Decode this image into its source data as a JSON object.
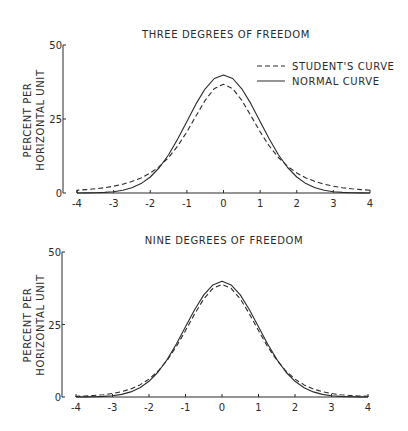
{
  "chart_data": [
    {
      "type": "line",
      "title": "THREE DEGREES OF FREEDOM",
      "xlabel": "",
      "ylabel": [
        "PERCENT PER",
        "HORIZONTAL UNIT"
      ],
      "xlim": [
        -4,
        4
      ],
      "ylim": [
        0,
        50
      ],
      "x_ticks": [
        "-4",
        "-3",
        "-2",
        "-1",
        "0",
        "1",
        "2",
        "3",
        "4"
      ],
      "y_ticks": [
        "0",
        "25",
        "50"
      ],
      "grid": false,
      "legend_position": "upper right",
      "x": [
        -4,
        -3.75,
        -3.5,
        -3.25,
        -3,
        -2.75,
        -2.5,
        -2.25,
        -2,
        -1.75,
        -1.5,
        -1.25,
        -1,
        -0.75,
        -0.5,
        -0.25,
        0,
        0.25,
        0.5,
        0.75,
        1,
        1.25,
        1.5,
        1.75,
        2,
        2.25,
        2.5,
        2.75,
        3,
        3.25,
        3.5,
        3.75,
        4
      ],
      "series": [
        {
          "name": "STUDENT'S CURVE",
          "style": "dashed",
          "values": [
            0.92,
            1.14,
            1.42,
            1.8,
            2.3,
            2.97,
            3.87,
            5.09,
            6.75,
            9.0,
            12.0,
            15.89,
            20.67,
            26.06,
            31.32,
            35.27,
            36.76,
            35.27,
            31.32,
            26.06,
            20.67,
            15.89,
            12.0,
            9.0,
            6.75,
            5.09,
            3.87,
            2.97,
            2.3,
            1.8,
            1.42,
            1.14,
            0.92
          ]
        },
        {
          "name": "NORMAL CURVE",
          "style": "solid",
          "values": [
            0.01,
            0.04,
            0.09,
            0.2,
            0.44,
            0.91,
            1.75,
            3.17,
            5.4,
            8.63,
            12.95,
            18.26,
            24.2,
            30.11,
            35.21,
            38.67,
            39.89,
            38.67,
            35.21,
            30.11,
            24.2,
            18.26,
            12.95,
            8.63,
            5.4,
            3.17,
            1.75,
            0.91,
            0.44,
            0.2,
            0.09,
            0.04,
            0.01
          ]
        }
      ]
    },
    {
      "type": "line",
      "title": "NINE DEGREES OF FREEDOM",
      "xlabel": "",
      "ylabel": [
        "PERCENT PER",
        "HORIZONTAL UNIT"
      ],
      "xlim": [
        -4,
        4
      ],
      "ylim": [
        0,
        50
      ],
      "x_ticks": [
        "-4",
        "-3",
        "-2",
        "-1",
        "0",
        "1",
        "2",
        "3",
        "4"
      ],
      "y_ticks": [
        "0",
        "25",
        "50"
      ],
      "grid": false,
      "legend_position": "none",
      "x": [
        -4,
        -3.75,
        -3.5,
        -3.25,
        -3,
        -2.75,
        -2.5,
        -2.25,
        -2,
        -1.75,
        -1.5,
        -1.25,
        -1,
        -0.75,
        -0.5,
        -0.25,
        0,
        0.25,
        0.5,
        0.75,
        1,
        1.25,
        1.5,
        1.75,
        2,
        2.25,
        2.5,
        2.75,
        3,
        3.25,
        3.5,
        3.75,
        4
      ],
      "series": [
        {
          "name": "STUDENT'S CURVE",
          "style": "dashed",
          "values": [
            0.24,
            0.35,
            0.53,
            0.8,
            1.21,
            1.84,
            2.77,
            4.17,
            6.18,
            8.97,
            12.71,
            17.42,
            22.91,
            28.65,
            33.83,
            37.48,
            38.8,
            37.48,
            33.83,
            28.65,
            22.91,
            17.42,
            12.71,
            8.97,
            6.18,
            4.17,
            2.77,
            1.84,
            1.21,
            0.8,
            0.53,
            0.35,
            0.24
          ]
        },
        {
          "name": "NORMAL CURVE",
          "style": "solid",
          "values": [
            0.01,
            0.04,
            0.09,
            0.2,
            0.44,
            0.91,
            1.75,
            3.17,
            5.4,
            8.63,
            12.95,
            18.26,
            24.2,
            30.11,
            35.21,
            38.67,
            39.89,
            38.67,
            35.21,
            30.11,
            24.2,
            18.26,
            12.95,
            8.63,
            5.4,
            3.17,
            1.75,
            0.91,
            0.44,
            0.2,
            0.09,
            0.04,
            0.01
          ]
        }
      ]
    }
  ],
  "layout": {
    "panels": [
      {
        "top": 0,
        "axis_x": 63,
        "plot_left": 77,
        "plot_right": 370,
        "y0": 193,
        "y50": 45,
        "title_y": 38,
        "title_x": 226
      },
      {
        "top": 0,
        "axis_x": 62,
        "plot_left": 76,
        "plot_right": 368,
        "y0": 397,
        "y50": 252,
        "title_y": 244,
        "title_x": 224
      }
    ],
    "ink_color": "#2a2a2a"
  }
}
